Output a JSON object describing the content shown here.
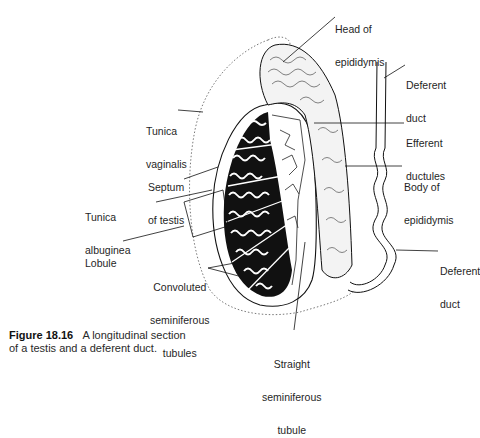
{
  "figure": {
    "number": "Figure 18.16",
    "caption_line1": "A longitudinal section",
    "caption_line2": "of a testis and a deferent duct."
  },
  "labels": {
    "head_of_epididymis": {
      "line1": "Head of",
      "line2": "epididymis"
    },
    "deferent_duct_top": {
      "line1": "Deferent",
      "line2": "duct"
    },
    "tunica_vaginalis": {
      "line1": "Tunica",
      "line2": "vaginalis"
    },
    "efferent_ductules": {
      "line1": "Efferent",
      "line2": "ductules"
    },
    "septum_of_testis": {
      "line1": "Septum",
      "line2": "of testis"
    },
    "body_of_epididymis": {
      "line1": "Body of",
      "line2": "epididymis"
    },
    "tunica_albuginea": {
      "line1": "Tunica",
      "line2": "albuginea"
    },
    "lobule": {
      "line1": "Lobule"
    },
    "deferent_duct_bottom": {
      "line1": "Deferent",
      "line2": "duct"
    },
    "convoluted_seminiferous_tubules": {
      "line1": "Convoluted",
      "line2": "seminiferous",
      "line3": "tubules"
    },
    "straight_seminiferous_tubule": {
      "line1": "Straight",
      "line2": "seminiferous",
      "line3": "tubule"
    }
  },
  "colors": {
    "ink": "#111111",
    "background": "#ffffff",
    "label_text": "#1f1f1f"
  }
}
